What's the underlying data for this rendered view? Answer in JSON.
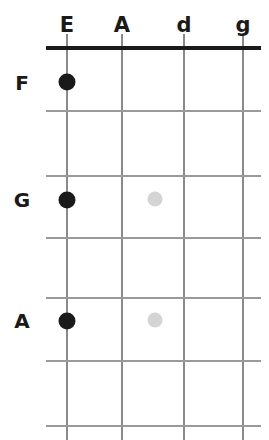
{
  "diagram": {
    "width": 269,
    "height": 440,
    "background_color": "#ffffff",
    "nut": {
      "label": "nut",
      "x1": 46,
      "x2": 261,
      "y": 48,
      "thickness": 4,
      "color": "#1a1a1a"
    },
    "strings": [
      {
        "label": "E",
        "x": 67,
        "header_y": 25,
        "line_color": "#8a8a8a"
      },
      {
        "label": "A",
        "x": 122,
        "header_y": 25,
        "line_color": "#8a8a8a"
      },
      {
        "label": "d",
        "x": 184,
        "header_y": 25,
        "line_color": "#8a8a8a"
      },
      {
        "label": "g",
        "x": 243,
        "header_y": 25,
        "line_color": "#8a8a8a"
      }
    ],
    "string_line_top": 34,
    "string_line_bottom": 440,
    "frets": [
      {
        "index": 1,
        "y": 110,
        "x1": 46,
        "x2": 261,
        "color": "#9a9a9a"
      },
      {
        "index": 2,
        "y": 175,
        "x1": 46,
        "x2": 261,
        "color": "#9a9a9a"
      },
      {
        "index": 3,
        "y": 237,
        "x1": 46,
        "x2": 261,
        "color": "#9a9a9a"
      },
      {
        "index": 4,
        "y": 297,
        "x1": 46,
        "x2": 261,
        "color": "#9a9a9a"
      },
      {
        "index": 5,
        "y": 360,
        "x1": 46,
        "x2": 261,
        "color": "#9a9a9a"
      },
      {
        "index": 6,
        "y": 425,
        "x1": 46,
        "x2": 261,
        "color": "#9a9a9a"
      }
    ],
    "note_labels": [
      {
        "label": "F",
        "x": 22,
        "y": 83
      },
      {
        "label": "G",
        "x": 22,
        "y": 200
      },
      {
        "label": "A",
        "x": 22,
        "y": 321
      }
    ],
    "dots": [
      {
        "kind": "filled",
        "string": "E",
        "note": "F",
        "x": 67,
        "y": 82,
        "size": 17,
        "color": "#1a1a1a"
      },
      {
        "kind": "filled",
        "string": "E",
        "note": "G",
        "x": 67,
        "y": 200,
        "size": 17,
        "color": "#1a1a1a"
      },
      {
        "kind": "filled",
        "string": "E",
        "note": "A",
        "x": 67,
        "y": 321,
        "size": 17,
        "color": "#1a1a1a"
      },
      {
        "kind": "marker",
        "string": "",
        "note": "",
        "x": 155,
        "y": 199,
        "size": 15,
        "color": "#d4d4d4"
      },
      {
        "kind": "marker",
        "string": "",
        "note": "",
        "x": 155,
        "y": 320,
        "size": 15,
        "color": "#d4d4d4"
      }
    ]
  }
}
